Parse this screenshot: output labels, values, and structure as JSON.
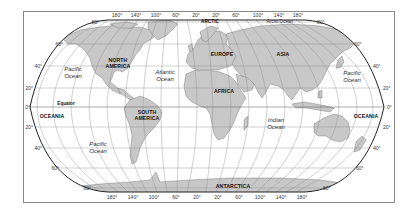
{
  "map": {
    "colors": {
      "land": "#c8c8c8",
      "land_stroke": "#6a6a6a",
      "water": "#ffffff",
      "grid": "#8a8a8a",
      "outline": "#222222",
      "frame": "#888888"
    },
    "longitude_labels_top": [
      "180°",
      "140°",
      "100°",
      "60°",
      "20°",
      "20°",
      "60°",
      "100°",
      "140°",
      "180°"
    ],
    "longitude_labels_bottom": [
      "180°",
      "140°",
      "100°",
      "60°",
      "20°",
      "20°",
      "60°",
      "100°",
      "140°",
      "180°"
    ],
    "latitude_labels_left": [
      "80°",
      "60°",
      "40°",
      "20°",
      "0°",
      "20°",
      "40°",
      "60°",
      "80°"
    ],
    "latitude_labels_right": [
      "80°",
      "60°",
      "40°",
      "20°",
      "0°",
      "20°",
      "40°",
      "60°",
      "80°"
    ],
    "continents": {
      "north_america_line1": "NORTH",
      "north_america_line2": "AMERICA",
      "south_america_line1": "SOUTH",
      "south_america_line2": "AMERICA",
      "europe": "EUROPE",
      "asia": "ASIA",
      "africa": "AFRICA",
      "oceania_left": "OCEANIA",
      "oceania_right": "OCEANIA",
      "antarctica": "ANTARCTICA",
      "arctic": "ARCTIC"
    },
    "oceans": {
      "pacific_nw_line1": "Pacific",
      "pacific_nw_line2": "Ocean",
      "pacific_ne_line1": "Pacific",
      "pacific_ne_line2": "Ocean",
      "pacific_s_line1": "Pacific",
      "pacific_s_line2": "Ocean",
      "atlantic_line1": "Atlantic",
      "atlantic_line2": "Ocean",
      "indian_line1": "Indian",
      "indian_line2": "Ocean",
      "arctic_ocean": "Arctic Ocean"
    },
    "equator_label": "Equator"
  }
}
